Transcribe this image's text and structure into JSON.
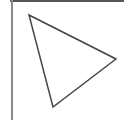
{
  "diagram": {
    "shape": "triangle",
    "vertices": [
      [
        29,
        15
      ],
      [
        116,
        59
      ],
      [
        53,
        107
      ]
    ],
    "stroke_color": "#444444",
    "stroke_width": 1.5,
    "fill": "none",
    "background": "#ffffff",
    "frame": {
      "top_color": "#555555",
      "left_color": "#8a8a8a"
    }
  }
}
